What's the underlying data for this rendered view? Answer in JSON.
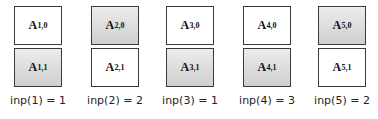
{
  "colors": {
    "shaded_top": "#ececec",
    "shaded_bottom": "#cfcfcf",
    "border": "#3a3a3a",
    "plain": "#ffffff"
  },
  "columns": [
    {
      "index": 1,
      "top": {
        "base": "A",
        "sub": "1,0",
        "shaded": false
      },
      "bottom": {
        "base": "A",
        "sub": "1,1",
        "shaded": true
      },
      "label": "inp(1) = 1"
    },
    {
      "index": 2,
      "top": {
        "base": "A",
        "sub": "2,0",
        "shaded": true
      },
      "bottom": {
        "base": "A",
        "sub": "2,1",
        "shaded": false
      },
      "label": "inp(2) = 2"
    },
    {
      "index": 3,
      "top": {
        "base": "A",
        "sub": "3,0",
        "shaded": false
      },
      "bottom": {
        "base": "A",
        "sub": "3,1",
        "shaded": true
      },
      "label": "inp(3) = 1"
    },
    {
      "index": 4,
      "top": {
        "base": "A",
        "sub": "4,0",
        "shaded": false
      },
      "bottom": {
        "base": "A",
        "sub": "4,1",
        "shaded": true
      },
      "label": "inp(4) = 3"
    },
    {
      "index": 5,
      "top": {
        "base": "A",
        "sub": "5,0",
        "shaded": true
      },
      "bottom": {
        "base": "A",
        "sub": "5,1",
        "shaded": false
      },
      "label": "inp(5) = 2"
    }
  ]
}
